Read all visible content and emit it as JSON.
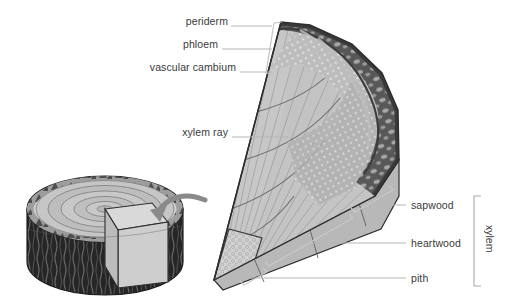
{
  "figure": {
    "labels_left": [
      {
        "id": "periderm",
        "text": "periderm",
        "x": 173,
        "y": 21,
        "leader_to_x": 268,
        "leader_y": 26
      },
      {
        "id": "phloem",
        "text": "phloem",
        "x": 189,
        "y": 44,
        "leader_to_x": 268,
        "leader_y": 49
      },
      {
        "id": "vascular-cambium",
        "text": "vascular cambium",
        "x": 145,
        "y": 67,
        "leader_to_x": 268,
        "leader_y": 72
      },
      {
        "id": "xylem-ray",
        "text": "xylem ray",
        "x": 186,
        "y": 132,
        "leader_to_x": 280,
        "leader_y": 137
      }
    ],
    "labels_right": [
      {
        "id": "sapwood",
        "text": "sapwood",
        "x": 411,
        "y": 200,
        "leader_from_x": 375,
        "leader_y": 205
      },
      {
        "id": "heartwood",
        "text": "heartwood",
        "x": 411,
        "y": 238,
        "leader_from_x": 312,
        "leader_y": 243
      },
      {
        "id": "pith",
        "text": "pith",
        "x": 411,
        "y": 273,
        "leader_from_x": 248,
        "leader_y": 278
      }
    ],
    "bracket_label": {
      "id": "xylem",
      "text": "xylem",
      "x": 486,
      "y": 210
    },
    "colors": {
      "bark_dark": "#4a4a4a",
      "bark_mid": "#8e8e8e",
      "wood_light": "#c9c9c9",
      "wood_mid": "#b4b4b4",
      "log_bark": "#2b2b2b",
      "leader": "#b0b0b0",
      "outline": "#2d2d2d",
      "text": "#3a3a3a"
    }
  }
}
